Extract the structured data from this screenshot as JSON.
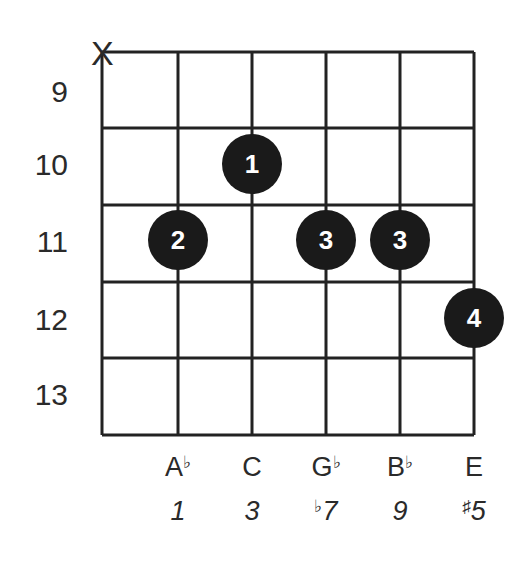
{
  "diagram": {
    "type": "guitar-chord-chart",
    "muted_strings": [
      {
        "string": 1,
        "symbol": "X"
      }
    ],
    "fret_labels": [
      "9",
      "10",
      "11",
      "12",
      "13"
    ],
    "fingers": [
      {
        "finger": "1",
        "string": 3,
        "fret": 10
      },
      {
        "finger": "2",
        "string": 2,
        "fret": 11
      },
      {
        "finger": "3",
        "string": 4,
        "fret": 11
      },
      {
        "finger": "3",
        "string": 5,
        "fret": 11
      },
      {
        "finger": "4",
        "string": 6,
        "fret": 12
      }
    ],
    "notes": [
      {
        "string": 2,
        "base": "A",
        "accidental": "♭"
      },
      {
        "string": 3,
        "base": "C",
        "accidental": ""
      },
      {
        "string": 4,
        "base": "G",
        "accidental": "♭"
      },
      {
        "string": 5,
        "base": "B",
        "accidental": "♭"
      },
      {
        "string": 6,
        "base": "E",
        "accidental": ""
      }
    ],
    "intervals": [
      {
        "string": 2,
        "accidental": "",
        "degree": "1"
      },
      {
        "string": 3,
        "accidental": "",
        "degree": "3"
      },
      {
        "string": 4,
        "accidental": "♭",
        "degree": "7"
      },
      {
        "string": 5,
        "accidental": "",
        "degree": "9"
      },
      {
        "string": 6,
        "accidental": "♯",
        "degree": "5"
      }
    ],
    "colors": {
      "line": "#222222",
      "dot": "#1a1a1a",
      "dot_text": "#ffffff"
    }
  }
}
